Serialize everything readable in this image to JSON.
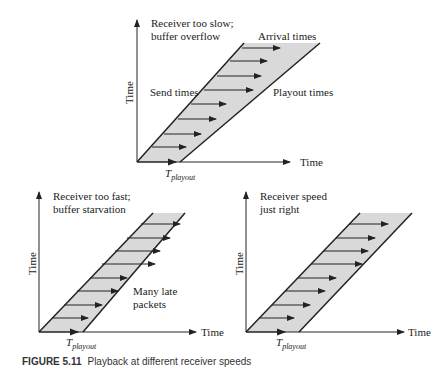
{
  "diagrams": [
    {
      "id": "top",
      "title_lines": [
        "Receiver too slow;",
        "buffer overflow"
      ],
      "labels": {
        "arrival": "Arrival times",
        "send": "Send times",
        "playout": "Playout times"
      },
      "x_axis": "Time",
      "y_axis": "Time",
      "tplayout_base": "T",
      "tplayout_sub": "playout"
    },
    {
      "id": "bottom-left",
      "title_lines": [
        "Receiver too fast;",
        "buffer starvation"
      ],
      "labels": {
        "late": "Many late",
        "late2": "packets"
      },
      "x_axis": "Time",
      "y_axis": "Time",
      "tplayout_base": "T",
      "tplayout_sub": "playout"
    },
    {
      "id": "bottom-right",
      "title_lines": [
        "Receiver speed",
        "just right"
      ],
      "x_axis": "Time",
      "y_axis": "Time",
      "tplayout_base": "T",
      "tplayout_sub": "playout"
    }
  ],
  "caption": {
    "number": "FIGURE 5.11",
    "text": "Playback at different receiver speeds"
  },
  "colors": {
    "band": "#d9d9d9",
    "line": "#222222"
  }
}
